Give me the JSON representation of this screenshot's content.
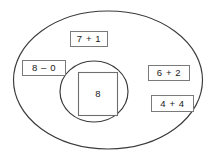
{
  "diagram": {
    "outer_region": {
      "name": "outer-ellipse",
      "fill_color": "#ffffff",
      "stroke_color": "#3a3a3a"
    },
    "inner_region": {
      "name": "inner-circle",
      "fill_color": "#ffffff",
      "stroke_color": "#3a3a3a"
    },
    "center": {
      "label": "8",
      "box_stroke_color": "#6e6e6e"
    },
    "facts": [
      {
        "label": "7 + 1",
        "position": "top-center"
      },
      {
        "label": "8 – 0",
        "position": "left"
      },
      {
        "label": "6 + 2",
        "position": "right-upper"
      },
      {
        "label": "4 + 4",
        "position": "right-lower"
      }
    ]
  }
}
